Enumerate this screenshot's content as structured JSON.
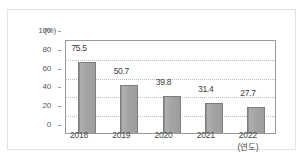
{
  "figure": {
    "top_fragment": "",
    "y_unit_label": "(%)",
    "x_unit_label": "(연도)"
  },
  "chart_data": {
    "type": "bar",
    "title": "",
    "subtitle": "",
    "xlabel": "(연도)",
    "ylabel": "(%)",
    "categories": [
      "2018",
      "2019",
      "2020",
      "2021",
      "2022"
    ],
    "values": [
      75.5,
      50.7,
      39.8,
      31.4,
      27.7
    ],
    "value_labels": [
      "75.5",
      "50.7",
      "39.8",
      "31.4",
      "27.7"
    ],
    "ylim": [
      0,
      100
    ],
    "yticks": [
      0,
      20,
      40,
      60,
      80,
      100
    ],
    "ytick_labels": [
      "0",
      "20",
      "40",
      "60",
      "80",
      "100"
    ],
    "grid": true,
    "grid_axis": "y",
    "legend": false,
    "legend_position": "none",
    "series": [
      {
        "name": "",
        "values": [
          75.5,
          50.7,
          39.8,
          31.4,
          27.7
        ],
        "color": "#a3a3a3"
      }
    ],
    "colors": {
      "bar_fill": "#a3a3a3",
      "bar_edge": "#7d7d7d",
      "axis": "#9a9a9a",
      "grid": "#bdbdbd",
      "text": "#4a4a4a",
      "frame": "#e3e3e3",
      "background": "#ffffff"
    }
  }
}
